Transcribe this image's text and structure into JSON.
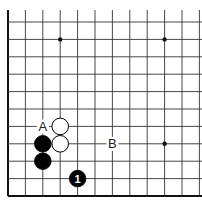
{
  "diagram": {
    "type": "go-board-fragment",
    "visible_edges": [
      "left",
      "bottom"
    ],
    "grid": {
      "columns": 12,
      "rows": 11,
      "origin_x": 8,
      "origin_y": 22,
      "spacing": 17.4,
      "line_color": "#333333",
      "edge_color": "#111111"
    },
    "star_points": [
      {
        "col": 3,
        "row": 1
      },
      {
        "col": 9,
        "row": 1
      },
      {
        "col": 9,
        "row": 7
      }
    ],
    "stones": [
      {
        "color": "white",
        "col": 3,
        "row": 6,
        "label": ""
      },
      {
        "color": "white",
        "col": 3,
        "row": 7,
        "label": ""
      },
      {
        "color": "black",
        "col": 2,
        "row": 7,
        "label": ""
      },
      {
        "color": "black",
        "col": 2,
        "row": 8,
        "label": ""
      },
      {
        "color": "black",
        "col": 4,
        "row": 9,
        "label": "1"
      }
    ],
    "markers": [
      {
        "text": "A",
        "col": 2,
        "row": 6
      },
      {
        "text": "B",
        "col": 6,
        "row": 7
      }
    ]
  }
}
